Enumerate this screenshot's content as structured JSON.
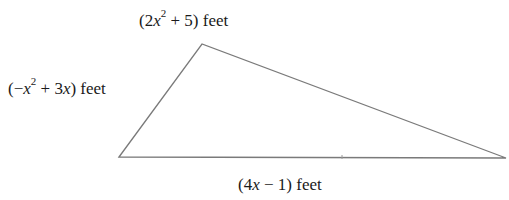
{
  "diagram": {
    "type": "triangle",
    "stroke_color": "#7a7a7a",
    "vertices": {
      "bottom_left": [
        119,
        157
      ],
      "top": [
        202,
        44
      ],
      "right": [
        506,
        158
      ]
    },
    "base_tick_x": 342,
    "sides": {
      "top": {
        "pre": "(2",
        "var": "x",
        "exp": "2",
        "post": " + 5) feet"
      },
      "left": {
        "pre": "(−",
        "var": "x",
        "exp": "2",
        "post": " + 3",
        "var2": "x",
        "post2": ") feet"
      },
      "base": {
        "pre": "(4",
        "var": "x",
        "post": " − 1) feet"
      }
    }
  }
}
